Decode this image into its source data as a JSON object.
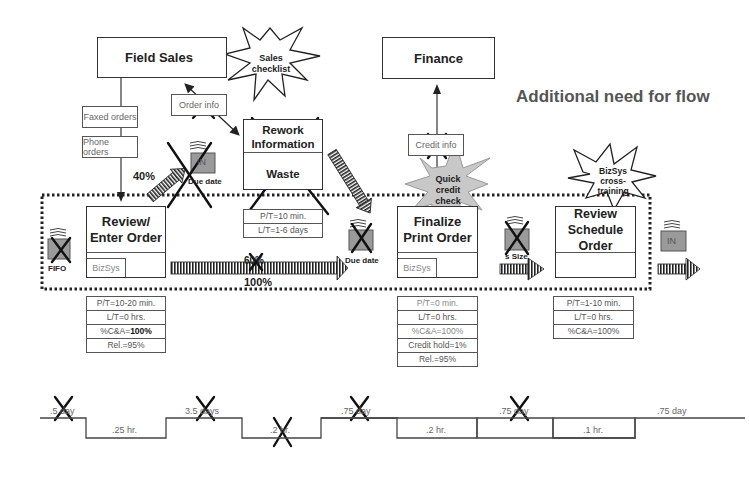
{
  "title": "Additional need for flow",
  "external": {
    "field_sales": "Field Sales",
    "finance": "Finance"
  },
  "info_flows": {
    "faxed_orders": "Faxed orders",
    "phone_orders": "Phone orders",
    "order_info": "Order info",
    "credit_info": "Credit info"
  },
  "kaizen_bursts": {
    "sales_checklist": [
      "Sales",
      "checklist"
    ],
    "quick_credit_check": [
      "Quick",
      "credit",
      "check"
    ],
    "bizsys_cross_training": [
      "BizSys",
      "cross-",
      "training"
    ]
  },
  "rework": {
    "title_line1": "Rework",
    "title_line2": "Information",
    "waste": "Waste",
    "data": [
      "P/T=10 min.",
      "L/T=1-6 days"
    ]
  },
  "inventory": {
    "in_due_date_top": {
      "box": "IN",
      "label": "Due date"
    },
    "fifo": {
      "box": "IN",
      "label": "FIFO"
    },
    "due_date_mid": {
      "box": "IN",
      "label": "Due date"
    },
    "size": {
      "box": "IN",
      "label": "s Size"
    },
    "final_in": {
      "box": "IN"
    }
  },
  "percentages": {
    "p40": "40%",
    "p60": "60%",
    "p100": "100%"
  },
  "processes": [
    {
      "name_line1": "Review/",
      "name_line2": "Enter Order",
      "system": "BizSys",
      "data": [
        "P/T=10-20 min.",
        "L/T=0 hrs.",
        "%C&A=",
        "Rel.=95%"
      ],
      "ca_value": "100%"
    },
    {
      "name_line1": "Finalize",
      "name_line2": "Print Order",
      "system": "BizSys",
      "data": [
        "P/T=0 min.",
        "L/T=0 hrs.",
        "%C&A=100%",
        "Credit hold=1%",
        "Rel.=95%"
      ]
    },
    {
      "name_line1": "Review",
      "name_line2": "Schedule Order",
      "system": "",
      "data": [
        "P/T=1-10 min.",
        "L/T=0 hrs.",
        "%C&A=100%"
      ]
    }
  ],
  "timeline": {
    "top": [
      ".5 day",
      "3.5 days",
      ".75 day",
      ".75 day",
      ".75 day"
    ],
    "bottom": [
      ".25 hr.",
      ".2 hr.",
      ".2 hr.",
      ".1 hr."
    ]
  },
  "colors": {
    "line": "#333333",
    "inventory_fill": "#9a9a9a",
    "burst_gray": "#c8c8c8",
    "title_gray": "#555555"
  }
}
